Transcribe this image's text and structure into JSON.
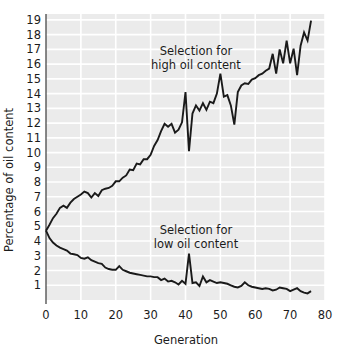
{
  "chart_data": {
    "type": "line",
    "title": "",
    "xlabel": "Generation",
    "ylabel": "Percentage of oil content",
    "xlim": [
      0,
      80
    ],
    "ylim": [
      0,
      19.4
    ],
    "xticks": [
      0,
      10,
      20,
      30,
      40,
      50,
      60,
      70,
      80
    ],
    "xtick_labels": [
      "0",
      "10",
      "20",
      "30",
      "40",
      "50",
      "60",
      "70",
      "80"
    ],
    "yticks": [
      1,
      2,
      3,
      4,
      5,
      6,
      7,
      8,
      9,
      10,
      11,
      12,
      13,
      14,
      15,
      16,
      17,
      18,
      19
    ],
    "ytick_labels": [
      "1",
      "2",
      "3",
      "4",
      "5",
      "6",
      "7",
      "8",
      "9",
      "10",
      "11",
      "12",
      "13",
      "14",
      "15",
      "16",
      "17",
      "18",
      "19"
    ],
    "grid": true,
    "grid_color": "#ffffff",
    "plot_bg": "#ebebeb",
    "line_color": "#1a1a1a",
    "legend_position": "inline-annotations",
    "annotations": [
      {
        "name": "high-selection-annotation",
        "line1": "Selection for",
        "line2": "high oil content",
        "x": 43,
        "y": 16.6
      },
      {
        "name": "low-selection-annotation",
        "line1": "Selection for",
        "line2": "low oil content",
        "x": 43,
        "y": 4.45
      }
    ],
    "series": [
      {
        "name": "Selection for high oil content",
        "x": [
          0,
          1,
          2,
          3,
          4,
          5,
          6,
          7,
          8,
          9,
          10,
          11,
          12,
          13,
          14,
          15,
          16,
          17,
          18,
          19,
          20,
          21,
          22,
          23,
          24,
          25,
          26,
          27,
          28,
          29,
          30,
          31,
          32,
          33,
          34,
          35,
          36,
          37,
          38,
          39,
          40,
          41,
          42,
          43,
          44,
          45,
          46,
          47,
          48,
          49,
          50,
          51,
          52,
          53,
          54,
          55,
          56,
          57,
          58,
          59,
          60,
          61,
          62,
          63,
          64,
          65,
          66,
          67,
          68,
          69,
          70,
          71,
          72,
          73,
          74,
          75,
          76
        ],
        "values": [
          4.7,
          5.1,
          5.55,
          5.85,
          6.25,
          6.4,
          6.25,
          6.6,
          6.85,
          7.0,
          7.15,
          7.35,
          7.25,
          6.95,
          7.25,
          7.05,
          7.45,
          7.55,
          7.6,
          7.75,
          8.05,
          8.05,
          8.3,
          8.45,
          8.85,
          8.8,
          9.25,
          9.2,
          9.55,
          9.55,
          9.85,
          10.45,
          10.85,
          11.45,
          11.95,
          11.75,
          11.95,
          11.35,
          11.55,
          12.05,
          14.1,
          10.1,
          12.65,
          13.2,
          12.85,
          13.35,
          12.9,
          13.45,
          13.35,
          14.0,
          15.35,
          13.8,
          13.9,
          13.2,
          11.9,
          14.1,
          14.55,
          14.7,
          14.65,
          14.95,
          15.05,
          15.25,
          15.35,
          15.55,
          15.7,
          16.7,
          15.35,
          17.0,
          16.05,
          17.6,
          16.05,
          17.05,
          15.25,
          17.25,
          18.15,
          17.6,
          18.95
        ]
      },
      {
        "name": "Selection for low oil content",
        "x": [
          0,
          1,
          2,
          3,
          4,
          5,
          6,
          7,
          8,
          9,
          10,
          11,
          12,
          13,
          14,
          15,
          16,
          17,
          18,
          19,
          20,
          21,
          22,
          23,
          24,
          25,
          26,
          27,
          28,
          29,
          30,
          31,
          32,
          33,
          34,
          35,
          36,
          37,
          38,
          39,
          40,
          41,
          42,
          43,
          44,
          45,
          46,
          47,
          48,
          49,
          50,
          51,
          52,
          53,
          54,
          55,
          56,
          57,
          58,
          59,
          60,
          61,
          62,
          63,
          64,
          65,
          66,
          67,
          68,
          69,
          70,
          71,
          72,
          73,
          74,
          75,
          76
        ],
        "values": [
          4.7,
          4.2,
          3.9,
          3.7,
          3.55,
          3.45,
          3.35,
          3.15,
          3.1,
          3.05,
          2.85,
          2.8,
          2.9,
          2.7,
          2.6,
          2.5,
          2.45,
          2.2,
          2.1,
          2.05,
          2.05,
          2.3,
          2.05,
          1.95,
          1.85,
          1.8,
          1.75,
          1.7,
          1.65,
          1.6,
          1.6,
          1.55,
          1.55,
          1.35,
          1.45,
          1.25,
          1.3,
          1.2,
          1.05,
          1.3,
          1.1,
          3.15,
          1.15,
          1.2,
          0.95,
          1.6,
          1.2,
          1.35,
          1.25,
          1.15,
          1.2,
          1.15,
          1.1,
          1.0,
          0.9,
          0.85,
          0.95,
          1.2,
          1.0,
          0.9,
          0.85,
          0.8,
          0.75,
          0.8,
          0.75,
          0.65,
          0.7,
          0.85,
          0.8,
          0.75,
          0.6,
          0.7,
          0.8,
          0.6,
          0.5,
          0.45,
          0.6
        ]
      }
    ]
  }
}
